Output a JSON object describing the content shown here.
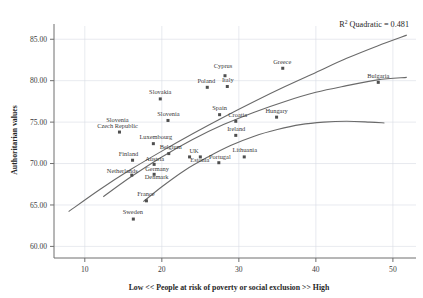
{
  "chart_data": {
    "type": "scatter",
    "title": "",
    "xlabel": "Low << People at risk of poverty or social exclusion >> High",
    "ylabel": "Authoritarian values",
    "xlim": [
      6,
      53
    ],
    "ylim": [
      58.6,
      86.6
    ],
    "xticks": [
      10,
      20,
      30,
      40,
      50
    ],
    "yticks": [
      60.0,
      65.0,
      70.0,
      75.0,
      80.0,
      85.0
    ],
    "xticklabels": [
      "10",
      "20",
      "30",
      "40",
      "50"
    ],
    "yticklabels": [
      "60.00",
      "65.00",
      "70.00",
      "75.00",
      "80.00",
      "85.00"
    ],
    "grid": true,
    "legend": false,
    "annotation": {
      "prefix": "R",
      "superscript": "2",
      "text": " Quadratic = 0.481",
      "full": "R2 Quadratic = 0.481"
    },
    "point_color": "#4f4f4f",
    "curve_color": "#6a6a6a",
    "points": [
      {
        "label": "Czech Republic",
        "x": 14.5,
        "y": 73.8,
        "label_dx": -0.4,
        "label_dy": 0.75,
        "anchor": "middle"
      },
      {
        "label": "Slovenia",
        "x": 14.5,
        "y": 73.8,
        "label_dx": -0.4,
        "label_dy": 1.95,
        "anchor": "middle",
        "label_only": true
      },
      {
        "label": "Slovakia",
        "x": 19.8,
        "y": 77.8,
        "label_dx": 0.0,
        "label_dy": 0.9,
        "anchor": "middle"
      },
      {
        "label": "Slovenia",
        "x": 20.8,
        "y": 75.2,
        "label_dx": 0.1,
        "label_dy": 0.9,
        "anchor": "middle"
      },
      {
        "label": "Poland",
        "x": 25.9,
        "y": 79.2,
        "label_dx": -0.2,
        "label_dy": 0.9,
        "anchor": "middle"
      },
      {
        "label": "Cyprus",
        "x": 28.2,
        "y": 80.6,
        "label_dx": -0.4,
        "label_dy": 1.5,
        "anchor": "middle"
      },
      {
        "label": "Italy",
        "x": 28.5,
        "y": 79.3,
        "label_dx": 0.1,
        "label_dy": 0.9,
        "anchor": "middle"
      },
      {
        "label": "Greece",
        "x": 35.7,
        "y": 81.5,
        "label_dx": -0.1,
        "label_dy": 0.9,
        "anchor": "middle"
      },
      {
        "label": "Bulgaria",
        "x": 48.1,
        "y": 79.8,
        "label_dx": 0.0,
        "label_dy": 0.9,
        "anchor": "middle"
      },
      {
        "label": "Spain",
        "x": 27.5,
        "y": 75.9,
        "label_dx": 0.0,
        "label_dy": 0.85,
        "anchor": "middle"
      },
      {
        "label": "Croatia",
        "x": 29.6,
        "y": 75.1,
        "label_dx": 0.4,
        "label_dy": 0.85,
        "anchor": "middle"
      },
      {
        "label": "Hungary",
        "x": 34.9,
        "y": 75.6,
        "label_dx": 0.0,
        "label_dy": 0.9,
        "anchor": "middle"
      },
      {
        "label": "Ireland",
        "x": 29.6,
        "y": 73.4,
        "label_dx": 0.1,
        "label_dy": 0.9,
        "anchor": "middle"
      },
      {
        "label": "Luxembourg",
        "x": 18.9,
        "y": 72.4,
        "label_dx": 0.5,
        "label_dy": 0.9,
        "anchor": "middle"
      },
      {
        "label": "Belgium",
        "x": 20.9,
        "y": 71.2,
        "label_dx": 0.4,
        "label_dy": 0.9,
        "anchor": "middle"
      },
      {
        "label": "Finland",
        "x": 16.2,
        "y": 70.4,
        "label_dx": -0.8,
        "label_dy": 0.75,
        "anchor": "middle"
      },
      {
        "label": "Austria",
        "x": 19.0,
        "y": 69.9,
        "label_dx": 0.1,
        "label_dy": 0.75,
        "anchor": "middle"
      },
      {
        "label": "UK",
        "x": 23.6,
        "y": 70.8,
        "label_dx": 0.9,
        "label_dy": 0.8,
        "anchor": "middle"
      },
      {
        "label": "Estonia",
        "x": 25.0,
        "y": 70.8,
        "label_dx": -0.1,
        "label_dy": -1.1,
        "anchor": "middle"
      },
      {
        "label": "Portugal",
        "x": 27.4,
        "y": 70.1,
        "label_dx": 0.2,
        "label_dy": 0.8,
        "anchor": "middle"
      },
      {
        "label": "Lithuania",
        "x": 30.7,
        "y": 70.8,
        "label_dx": 0.1,
        "label_dy": 0.9,
        "anchor": "middle"
      },
      {
        "label": "Netherlands",
        "x": 16.1,
        "y": 68.6,
        "label_dx": -1.9,
        "label_dy": 0.35,
        "anchor": "middle"
      },
      {
        "label": "Germany",
        "x": 19.0,
        "y": 68.7,
        "label_dx": 0.6,
        "label_dy": 0.75,
        "anchor": "middle"
      },
      {
        "label": "Denmark",
        "x": 19.0,
        "y": 68.7,
        "label_dx": 0.5,
        "label_dy": -1.0,
        "anchor": "middle",
        "label_only": true
      },
      {
        "label": "France",
        "x": 18.0,
        "y": 65.5,
        "label_dx": -0.1,
        "label_dy": 0.9,
        "anchor": "middle"
      },
      {
        "label": "Sweden",
        "x": 16.3,
        "y": 63.3,
        "label_dx": -0.1,
        "label_dy": 0.95,
        "anchor": "middle"
      }
    ],
    "curves": [
      {
        "name": "upper-fit",
        "points": [
          [
            7.9,
            64.2
          ],
          [
            12,
            66.9
          ],
          [
            16,
            69.3
          ],
          [
            20,
            71.5
          ],
          [
            24,
            73.6
          ],
          [
            28,
            75.6
          ],
          [
            32,
            77.5
          ],
          [
            36,
            79.3
          ],
          [
            40,
            81.0
          ],
          [
            44,
            82.7
          ],
          [
            48,
            84.2
          ],
          [
            51.8,
            85.5
          ]
        ]
      },
      {
        "name": "middle-fit",
        "points": [
          [
            12.4,
            66.0
          ],
          [
            16,
            68.4
          ],
          [
            20,
            70.8
          ],
          [
            24,
            72.9
          ],
          [
            28,
            74.7
          ],
          [
            32,
            76.2
          ],
          [
            36,
            77.5
          ],
          [
            40,
            78.6
          ],
          [
            44,
            79.4
          ],
          [
            48,
            80.1
          ],
          [
            51.8,
            80.4
          ]
        ]
      },
      {
        "name": "lower-fit",
        "points": [
          [
            17.6,
            65.4
          ],
          [
            20,
            67.2
          ],
          [
            23,
            69.2
          ],
          [
            26,
            70.8
          ],
          [
            29,
            72.2
          ],
          [
            32,
            73.3
          ],
          [
            35,
            74.1
          ],
          [
            38,
            74.7
          ],
          [
            41,
            75.0
          ],
          [
            44,
            75.1
          ],
          [
            47,
            75.0
          ],
          [
            48.9,
            74.9
          ]
        ]
      }
    ]
  }
}
